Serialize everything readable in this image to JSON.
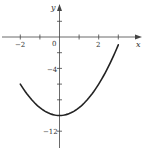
{
  "chart_data": {
    "type": "line",
    "title": "",
    "xlabel": "x",
    "ylabel": "y",
    "xlim": [
      -3,
      4
    ],
    "ylim": [
      -14,
      4.5
    ],
    "grid": false,
    "x_ticks": [
      -2,
      -1,
      0,
      1,
      2,
      3
    ],
    "x_tick_labels": {
      "-2": "−2",
      "0": "0",
      "2": "2"
    },
    "y_ticks": [
      2,
      -2,
      -4,
      -6,
      -8,
      -10,
      -12
    ],
    "y_tick_labels": {
      "-4": "−4",
      "-12": "−12"
    },
    "series": [
      {
        "name": "y = x^2 - 10",
        "x": [
          -2,
          -1.5,
          -1,
          -0.5,
          0,
          0.5,
          1,
          1.5,
          2,
          2.5,
          3
        ],
        "y": [
          -6,
          -7.75,
          -9,
          -9.75,
          -10,
          -9.75,
          -9,
          -7.75,
          -6,
          -3.75,
          -1
        ]
      }
    ],
    "colors": {
      "curve": "#222222",
      "axes": "#444444"
    }
  },
  "labels": {
    "x_axis": "x",
    "y_axis": "y",
    "origin": "0",
    "x_neg2": "−2",
    "x_2": "2",
    "y_neg4": "−4",
    "y_neg12": "−12"
  }
}
